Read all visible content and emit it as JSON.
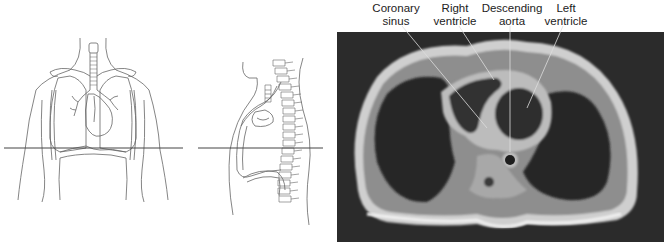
{
  "figures": {
    "coronal_drawing": {
      "description": "Front view of thorax with axial cut line"
    },
    "sagittal_drawing": {
      "description": "Side view of thorax with axial cut line"
    },
    "mri_image": {
      "description": "Axial MRI of the chest at the level of the heart"
    }
  },
  "labels": [
    {
      "id": "coronary-sinus",
      "line1": "Coronary",
      "line2": "sinus",
      "x": 396,
      "y": 2
    },
    {
      "id": "right-ventricle",
      "line1": "Right",
      "line2": "ventricle",
      "x": 455,
      "y": 2
    },
    {
      "id": "descending-aorta",
      "line1": "Descending",
      "line2": "aorta",
      "x": 512,
      "y": 2
    },
    {
      "id": "left-ventricle",
      "line1": "Left",
      "line2": "ventricle",
      "x": 566,
      "y": 2
    }
  ],
  "colors": {
    "line_art": "#555555",
    "cut_line": "#444444",
    "mri_background": "#2a2a2a",
    "leader_line": "#dddddd"
  }
}
